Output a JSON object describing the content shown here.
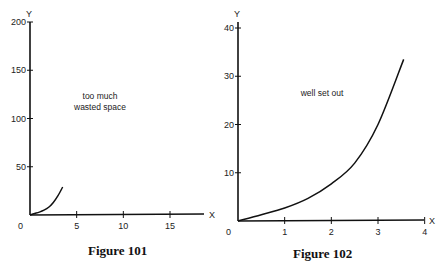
{
  "chart_data": [
    {
      "type": "line",
      "caption": "Figure 101",
      "annotation": "too much wasted space",
      "xlabel": "X",
      "ylabel": "Y",
      "origin_label": "0",
      "xlim": [
        0,
        18
      ],
      "ylim": [
        0,
        200
      ],
      "x_ticks": [
        5,
        10,
        15
      ],
      "y_ticks": [
        50,
        100,
        150,
        200
      ],
      "grid": false,
      "series": [
        {
          "name": "curve",
          "x": [
            0,
            0.5,
            1,
            1.5,
            2,
            2.5,
            3,
            3.5
          ],
          "y": [
            0,
            1.5,
            3,
            5,
            8,
            13,
            20,
            29
          ]
        }
      ]
    },
    {
      "type": "line",
      "caption": "Figure 102",
      "annotation": "well set out",
      "xlabel": "X",
      "ylabel": "Y",
      "origin_label": "0",
      "xlim": [
        0,
        4
      ],
      "ylim": [
        0,
        40
      ],
      "x_ticks": [
        1,
        2,
        3,
        4
      ],
      "y_ticks": [
        10,
        20,
        30,
        40
      ],
      "grid": false,
      "series": [
        {
          "name": "curve",
          "x": [
            0,
            0.5,
            1,
            1.5,
            2,
            2.5,
            3,
            3.55
          ],
          "y": [
            0,
            1.3,
            2.7,
            4.7,
            7.7,
            12,
            20,
            33.5
          ]
        }
      ]
    }
  ],
  "figures": [
    {
      "caption": "Figure 101",
      "annotation_line1": "too much",
      "annotation_line2": "wasted space"
    },
    {
      "caption": "Figure 102",
      "annotation_line1": "well set out"
    }
  ]
}
